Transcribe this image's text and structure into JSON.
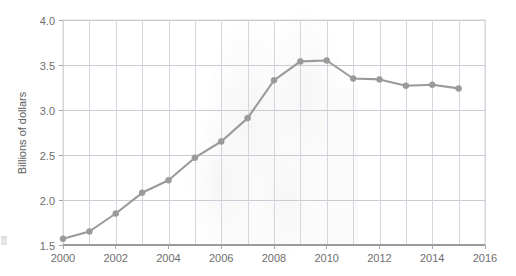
{
  "chart_data": {
    "type": "line",
    "title": "",
    "subtitle": "",
    "xlabel": "",
    "ylabel": "Billions of dollars",
    "xlim": [
      2000,
      2016
    ],
    "ylim": [
      1.5,
      4.0
    ],
    "ytick_step": 0.5,
    "xtick_step": 2,
    "grid": true,
    "legend": "none",
    "series_color": "#9a9a9a",
    "grid_color": "#c9ccd4",
    "background": "#ffffff",
    "marker": "circle",
    "x": [
      2000,
      2001,
      2002,
      2003,
      2004,
      2005,
      2006,
      2007,
      2008,
      2009,
      2010,
      2011,
      2012,
      2013,
      2014,
      2015
    ],
    "values": [
      1.57,
      1.65,
      1.85,
      2.08,
      2.22,
      2.47,
      2.65,
      2.91,
      3.33,
      3.54,
      3.55,
      3.35,
      3.34,
      3.27,
      3.28,
      3.24
    ],
    "xticks": [
      "2000",
      "2002",
      "2004",
      "2006",
      "2008",
      "2010",
      "2012",
      "2014",
      "2016"
    ],
    "xtick_values": [
      2000,
      2002,
      2004,
      2006,
      2008,
      2010,
      2012,
      2014,
      2016
    ],
    "yticks": [
      "1.5",
      "2.0",
      "2.5",
      "3.0",
      "3.5",
      "4.0"
    ],
    "ytick_values": [
      1.5,
      2.0,
      2.5,
      3.0,
      3.5,
      4.0
    ],
    "annotations": []
  }
}
